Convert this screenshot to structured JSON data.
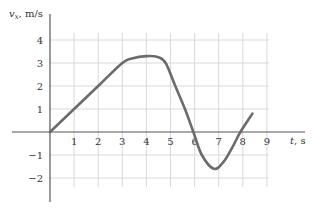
{
  "chart_data": {
    "type": "line",
    "title": "",
    "xlabel": "t, s",
    "ylabel": "v_x, m/s",
    "xlim": [
      0,
      9
    ],
    "ylim": [
      -2,
      4
    ],
    "grid": true,
    "x_ticks": [
      "1",
      "2",
      "3",
      "4",
      "5",
      "6",
      "7",
      "8",
      "9"
    ],
    "y_ticks": [
      "4",
      "3",
      "2",
      "1",
      "−1",
      "−2"
    ],
    "series": [
      {
        "name": "v_x(t)",
        "x": [
          0,
          1,
          2,
          3,
          3.4,
          4,
          4.5,
          4.8,
          5.2,
          5.6,
          5.95,
          6.3,
          6.8,
          7.2,
          7.6,
          7.9,
          8.4
        ],
        "y": [
          0,
          1,
          2,
          3,
          3.2,
          3.3,
          3.25,
          3.0,
          2.0,
          1.0,
          0.0,
          -1.0,
          -1.6,
          -1.3,
          -0.6,
          0.0,
          0.8
        ]
      }
    ],
    "line_color": "#6b6b6b"
  }
}
